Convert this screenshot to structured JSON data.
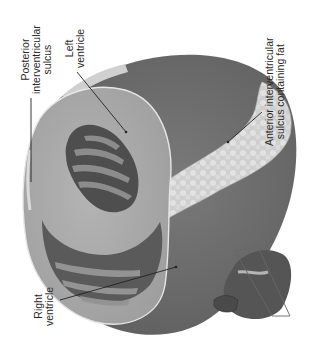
{
  "figure": {
    "colors": {
      "background": "#ffffff",
      "epicardium_dark": "#6e6e6e",
      "myocardium": "#a8a8a8",
      "myocardium_light": "#b9b9b9",
      "fat": "#d6d6d6",
      "cavity_dark": "#4a4a4a",
      "trabeculae": "#8a8a8a",
      "label_text": "#2a2a2a",
      "leader_line": "#222222"
    },
    "labels": [
      {
        "id": "posterior-interventricular-sulcus",
        "lines": [
          "Posterior",
          "interventricular",
          "sulcus"
        ]
      },
      {
        "id": "left-ventricle",
        "lines": [
          "Left",
          "ventricle"
        ]
      },
      {
        "id": "anterior-interventricular-sulcus",
        "lines": [
          "Anterior interventricular",
          "sulcus containing fat"
        ]
      },
      {
        "id": "right-ventricle",
        "lines": [
          "Right",
          "ventricle"
        ]
      }
    ],
    "inset": {
      "description": "Orientation thumbnail of whole heart with cutting plane"
    }
  }
}
